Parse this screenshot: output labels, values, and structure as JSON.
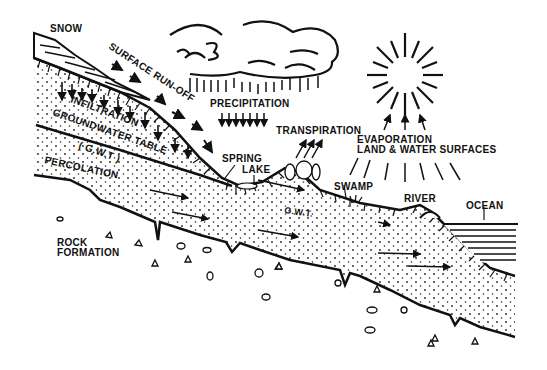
{
  "diagram": {
    "type": "hydrologic cycle cross-section",
    "colors": {
      "ink": "#111111",
      "background": "#ffffff"
    },
    "labels": {
      "snow": "SNOW",
      "surface_runoff": "SURFACE RUN-OFF",
      "precipitation": "PRECIPITATION",
      "transpiration": "TRANSPIRATION",
      "evaporation_1": "EVAPORATION",
      "evaporation_2": "LAND & WATER SURFACES",
      "infiltration": "INFILTRATION",
      "groundwater_table": "GROUNDWATER TABLE",
      "gwt_paren": "( G.W.T )",
      "percolation": "PERCOLATION",
      "spring": "SPRING",
      "lake": "LAKE",
      "gwt": "G.W.T.",
      "swamp": "SWAMP",
      "river": "RIVER",
      "ocean": "OCEAN",
      "rock_1": "ROCK",
      "rock_2": "FORMATION"
    }
  }
}
